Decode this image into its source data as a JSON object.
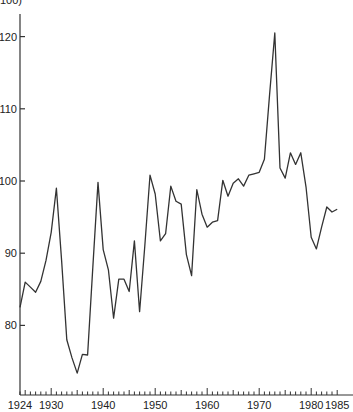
{
  "chart_data": {
    "type": "line",
    "title": "",
    "top_label_partial": "100)",
    "xlabel": "",
    "ylabel": "",
    "xlim": [
      1924,
      1985
    ],
    "ylim": [
      72,
      123
    ],
    "grid": false,
    "legend": null,
    "x_tick_labels": [
      "1924",
      "1930",
      "1940",
      "1950",
      "1960",
      "1970",
      "1980",
      "1985"
    ],
    "x_ticks": [
      1924,
      1930,
      1940,
      1950,
      1960,
      1970,
      1980,
      1985
    ],
    "y_tick_labels": [
      "80",
      "90",
      "100",
      "110",
      "120"
    ],
    "y_ticks": [
      80,
      90,
      100,
      110,
      120
    ],
    "series": [
      {
        "name": "index",
        "color": "#333333",
        "x": [
          1924,
          1925,
          1926,
          1927,
          1928,
          1929,
          1930,
          1931,
          1932,
          1933,
          1934,
          1935,
          1936,
          1937,
          1938,
          1939,
          1940,
          1941,
          1942,
          1943,
          1944,
          1945,
          1946,
          1947,
          1948,
          1949,
          1950,
          1951,
          1952,
          1953,
          1954,
          1955,
          1956,
          1957,
          1958,
          1959,
          1960,
          1961,
          1962,
          1963,
          1964,
          1965,
          1966,
          1967,
          1968,
          1969,
          1970,
          1971,
          1972,
          1973,
          1974,
          1975,
          1976,
          1977,
          1978,
          1979,
          1980,
          1981,
          1982,
          1983,
          1984,
          1985
        ],
        "values": [
          82.5,
          86,
          85.3,
          84.6,
          86.1,
          89,
          92.9,
          99,
          89,
          78,
          75.5,
          73.4,
          76,
          75.9,
          88,
          99.8,
          90.5,
          87.7,
          81,
          86.4,
          86.4,
          84.7,
          91.7,
          81.9,
          91,
          100.8,
          98.2,
          91.7,
          92.7,
          99.3,
          97.2,
          96.8,
          89.8,
          86.9,
          98.8,
          95.4,
          93.6,
          94.3,
          94.5,
          100.1,
          97.9,
          99.7,
          100.3,
          99.3,
          100.8,
          101,
          101.2,
          103,
          112,
          120.5,
          101.8,
          100.4,
          103.9,
          102.3,
          103.9,
          99.2,
          92.2,
          90.6,
          93.6,
          96.4,
          95.7,
          96.1
        ]
      }
    ]
  }
}
